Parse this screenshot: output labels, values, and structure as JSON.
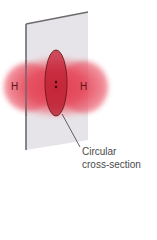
{
  "diagram": {
    "atoms": [
      {
        "symbol": "H",
        "position": "left"
      },
      {
        "symbol": "H",
        "position": "right"
      }
    ],
    "bond_electrons": ":",
    "caption_lines": [
      "Circular",
      "cross-section"
    ],
    "colors": {
      "electron_cloud": "#e23a4c",
      "plane": "#e6e4e8",
      "plane_edge": "#6d6a6e",
      "cross_section_outline": "#6a1a1a",
      "caption_text": "#4a4a4a"
    }
  }
}
